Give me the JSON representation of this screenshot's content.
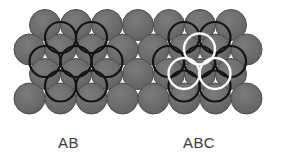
{
  "figure": {
    "background_color": "#fefefe",
    "width": 282,
    "height": 161
  },
  "sphere_layer": {
    "fill_color": "#6f6f6f",
    "edge_color": "#4d4d4d",
    "radius": 15.5,
    "rows": [
      {
        "y": 25.0,
        "x_start": 45.0,
        "spacing": 31.0,
        "count": 7
      },
      {
        "y": 49.5,
        "x_start": 29.5,
        "spacing": 31.0,
        "count": 8
      },
      {
        "y": 74.0,
        "x_start": 45.0,
        "spacing": 31.0,
        "count": 7
      },
      {
        "y": 98.5,
        "x_start": 29.5,
        "spacing": 31.0,
        "count": 8
      }
    ]
  },
  "overlay_black": {
    "stroke_color": "#141414",
    "stroke_width": 2.2,
    "radius": 15.5,
    "label": "second-layer spheres (B sites)",
    "circles": [
      {
        "cx": 60.5,
        "cy": 37.5
      },
      {
        "cx": 91.5,
        "cy": 37.5
      },
      {
        "cx": 45.0,
        "cy": 61.5
      },
      {
        "cx": 76.0,
        "cy": 61.5
      },
      {
        "cx": 107.0,
        "cy": 61.5
      },
      {
        "cx": 60.5,
        "cy": 86.0
      },
      {
        "cx": 91.5,
        "cy": 86.0
      },
      {
        "cx": 184.0,
        "cy": 37.5
      },
      {
        "cx": 215.0,
        "cy": 37.5
      },
      {
        "cx": 168.5,
        "cy": 61.5
      },
      {
        "cx": 199.5,
        "cy": 61.5
      },
      {
        "cx": 230.5,
        "cy": 61.5
      },
      {
        "cx": 184.0,
        "cy": 86.0
      },
      {
        "cx": 215.0,
        "cy": 86.0
      }
    ]
  },
  "overlay_white": {
    "stroke_color": "#fafafa",
    "stroke_width": 2.4,
    "radius": 15.5,
    "label": "third-layer spheres (C sites)",
    "circles": [
      {
        "cx": 199.5,
        "cy": 49.0
      },
      {
        "cx": 184.0,
        "cy": 73.5
      },
      {
        "cx": 215.0,
        "cy": 73.5
      }
    ]
  },
  "captions": {
    "left": "AB",
    "right": "ABC",
    "color": "#3b3b3b"
  }
}
